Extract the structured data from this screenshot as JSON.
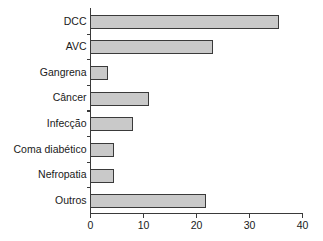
{
  "chart_data": {
    "type": "bar",
    "orientation": "horizontal",
    "title": "",
    "subtitle": "",
    "xlabel": "",
    "ylabel": "",
    "categories": [
      "DCC",
      "AVC",
      "Gangrena",
      "Câncer",
      "Infecção",
      "Coma diabético",
      "Nefropatia",
      "Outros"
    ],
    "values": [
      35.5,
      23,
      3.2,
      11,
      8,
      4.3,
      4.3,
      21.7
    ],
    "xlim": [
      0,
      40
    ],
    "xticks": [
      0,
      10,
      20,
      30,
      40
    ],
    "xtick_labels": [
      "0",
      "10",
      "20",
      "30",
      "40"
    ],
    "grid": false,
    "legend": null,
    "annotations": [],
    "bar_fill_color": "#c9c9c9",
    "bar_edge_color": "#3a3a3a",
    "axis_color": "#3a3a3a",
    "background_color": "#ffffff"
  }
}
